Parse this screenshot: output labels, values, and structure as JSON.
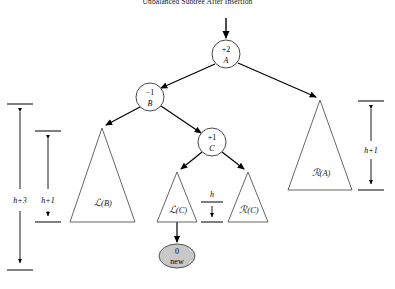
{
  "figure": {
    "title": "Unbalanced Subtree After Insertion",
    "colors": {
      "stroke": "#000000",
      "triangle_stroke": "#555555",
      "node_fill": "#ffffff",
      "new_node_fill": "#c8c8c8",
      "text": "#000000",
      "background": "#ffffff"
    }
  },
  "nodes": [
    {
      "id": "A",
      "balance_factor": "+2",
      "name": "A",
      "cx": 226,
      "cy": 54,
      "r": 14,
      "fill": "#ffffff"
    },
    {
      "id": "B",
      "balance_factor": "−1",
      "name": "B",
      "cx": 150,
      "cy": 97,
      "r": 14,
      "fill": "#ffffff"
    },
    {
      "id": "C",
      "balance_factor": "+1",
      "name": "C",
      "cx": 212,
      "cy": 142,
      "r": 14,
      "fill": "#ffffff"
    },
    {
      "id": "new",
      "balance_factor": "0",
      "name": "new",
      "cx": 177,
      "cy": 256,
      "rx": 18,
      "ry": 12,
      "fill": "#c8c8c8"
    }
  ],
  "subtrees": [
    {
      "id": "LB",
      "label_script": "L",
      "label_arg": "(B)",
      "label": "ℒ(B)",
      "apex_x": 102,
      "apex_y": 128,
      "base_left_x": 70,
      "base_right_x": 135,
      "base_y": 222
    },
    {
      "id": "LC",
      "label_script": "L",
      "label_arg": "(C)",
      "label": "ℒ(C)",
      "apex_x": 177,
      "apex_y": 172,
      "base_left_x": 157,
      "base_right_x": 197,
      "base_y": 222
    },
    {
      "id": "RC",
      "label_script": "R",
      "label_arg": "(C)",
      "label": "ℛ(C)",
      "apex_x": 248,
      "apex_y": 172,
      "base_left_x": 228,
      "base_right_x": 268,
      "base_y": 222
    },
    {
      "id": "RA",
      "label_script": "R",
      "label_arg": "(A)",
      "label": "ℛ(A)",
      "apex_x": 320,
      "apex_y": 100,
      "base_left_x": 288,
      "base_right_x": 352,
      "base_y": 190
    }
  ],
  "measurements": [
    {
      "id": "h-plus-3",
      "label": "h+3",
      "axis_x": 20,
      "top_y": 104,
      "bottom_y": 270,
      "tick_half_width": 13,
      "label_x": 20,
      "label_y": 200
    },
    {
      "id": "h-plus-1-left",
      "label": "h+1",
      "axis_x": 48,
      "top_y": 131,
      "bottom_y": 222,
      "tick_half_width": 13,
      "label_x": 48,
      "label_y": 200
    },
    {
      "id": "h-middle",
      "label": "h",
      "axis_x": 212,
      "top_y": 202,
      "bottom_y": 222,
      "tick_half_width": 11,
      "label_x": 212,
      "label_y": 195
    },
    {
      "id": "h-plus-1-right",
      "label": "h+1",
      "axis_x": 371,
      "top_y": 101,
      "bottom_y": 190,
      "tick_half_width": 13,
      "label_x": 371,
      "label_y": 150
    }
  ],
  "edges": [
    {
      "id": "root-inbound",
      "from": "above",
      "to": "A"
    },
    {
      "id": "A-to-B",
      "from": "A",
      "to": "B"
    },
    {
      "id": "A-to-RA",
      "from": "A",
      "to": "RA"
    },
    {
      "id": "B-to-LB",
      "from": "B",
      "to": "LB"
    },
    {
      "id": "B-to-C",
      "from": "B",
      "to": "C"
    },
    {
      "id": "C-to-LC",
      "from": "C",
      "to": "LC"
    },
    {
      "id": "C-to-RC",
      "from": "C",
      "to": "RC"
    },
    {
      "id": "LC-to-new",
      "from": "LC",
      "to": "new"
    }
  ]
}
